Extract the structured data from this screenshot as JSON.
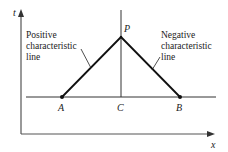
{
  "diagram": {
    "axes": {
      "vertical_label": "t",
      "horizontal_label": "x"
    },
    "points": {
      "A": "A",
      "B": "B",
      "C": "C",
      "P": "P"
    },
    "annotations": {
      "positive": [
        "Positive",
        "characteristic",
        "line"
      ],
      "negative": [
        "Negative",
        "characteristic",
        "line"
      ]
    },
    "colors": {
      "line": "#111111",
      "axis": "#555555",
      "background": "#ffffff"
    }
  }
}
